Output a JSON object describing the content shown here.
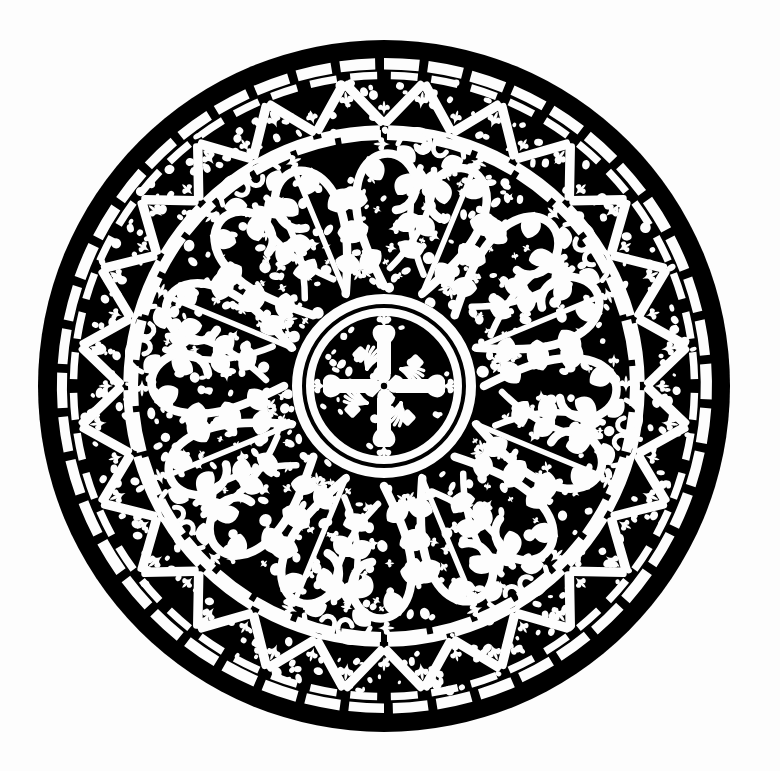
{
  "artwork": {
    "title": "Ornamental Circular Roundel",
    "medium": "black-and-white line engraving",
    "subject": "byzantine-foliate-rose-window-roundel",
    "canvas": {
      "width": 780,
      "height": 771,
      "background_color": "#fdfdfd"
    },
    "ink_color": "#000000",
    "paper_color": "#fdfdfd",
    "composition": {
      "center_x": 384,
      "center_y": 386,
      "outer_radius": 346,
      "symmetry": "bilateral about vertical axis, approximate 8-fold radial",
      "bands": [
        {
          "name": "outer-rim",
          "inner_radius": 330,
          "outer_radius": 346,
          "fill": "solid-black",
          "description": "heavy solid black circular rim"
        },
        {
          "name": "bead-ring",
          "inner_radius": 315,
          "outer_radius": 330,
          "fill": "white-blocks",
          "block_count": 46,
          "description": "ring of white rectangular beads separated by black mortar"
        },
        {
          "name": "chevron-band",
          "inner_radius": 252,
          "outer_radius": 315,
          "fill": "white-zigzag-bars",
          "chevron_count": 24,
          "description": "zigzag band of white bars forming triangles, each triangle filled with small trefoil leaves and pebble tesserae"
        },
        {
          "name": "rope-circle",
          "inner_radius": 246,
          "outer_radius": 256,
          "fill": "white-segmented-band",
          "description": "segmented circular rope band enclosing the foliate field"
        },
        {
          "name": "foliate-field",
          "inner_radius": 92,
          "outer_radius": 246,
          "fill": "vine-scrollwork",
          "scroll_count": 8,
          "description": "dense field of white vine scrolls, acanthus leaves, palmettes, buds and pebble ground"
        },
        {
          "name": "medallion-outer-circle",
          "inner_radius": 82,
          "outer_radius": 92,
          "fill": "white-band",
          "description": "outer circle of the central medallion"
        },
        {
          "name": "medallion-inner-circle",
          "inner_radius": 70,
          "outer_radius": 78,
          "fill": "white-band",
          "description": "inner concentric circle of the central medallion"
        },
        {
          "name": "central-cross",
          "inner_radius": 0,
          "outer_radius": 70,
          "fill": "four-fold-cross-motif",
          "description": "quadripartite cross with flaring arms, fleuron terminals and paired leaf sprays"
        }
      ]
    },
    "motifs": [
      {
        "name": "trefoil-leaf",
        "count": 48,
        "location": "chevron-band triangles"
      },
      {
        "name": "pebble-tessera",
        "count": 900,
        "location": "all bands"
      },
      {
        "name": "acanthus-scroll",
        "count": 8,
        "location": "foliate-field"
      },
      {
        "name": "palmette-bud",
        "count": 16,
        "location": "foliate-field"
      },
      {
        "name": "fleuron",
        "count": 4,
        "location": "central-cross terminals"
      },
      {
        "name": "leaf-spray",
        "count": 4,
        "location": "central-cross diagonals"
      }
    ],
    "seeds": {
      "pebble": 20250411,
      "foliate": 771780,
      "chevron": 24241
    }
  }
}
